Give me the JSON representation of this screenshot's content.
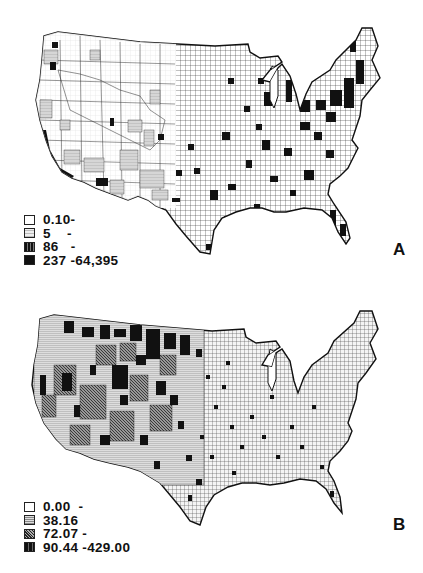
{
  "figure": {
    "panels": [
      {
        "id": "A",
        "label": "A",
        "map": "Contiguous United States, county-level choropleth",
        "legend": [
          {
            "label": "0.10-",
            "fill": "white"
          },
          {
            "label": "5    -",
            "fill": "light-stipple"
          },
          {
            "label": "86   -",
            "fill": "dark-hatch"
          },
          {
            "label": "237 -64,395",
            "fill": "black"
          }
        ]
      },
      {
        "id": "B",
        "label": "B",
        "map": "Contiguous United States, county-level choropleth",
        "legend": [
          {
            "label": "0.00  -",
            "fill": "white"
          },
          {
            "label": "38.16",
            "fill": "light-hatch"
          },
          {
            "label": "72.07 -",
            "fill": "dark-stipple"
          },
          {
            "label": "90.44 -429.00",
            "fill": "black-hatch"
          }
        ]
      }
    ]
  },
  "colors": {
    "background": "#ffffff",
    "ink": "#111111",
    "light_fill": "#cfcfcf",
    "mid_fill": "#7a7a7a",
    "dark_fill": "#111111"
  }
}
